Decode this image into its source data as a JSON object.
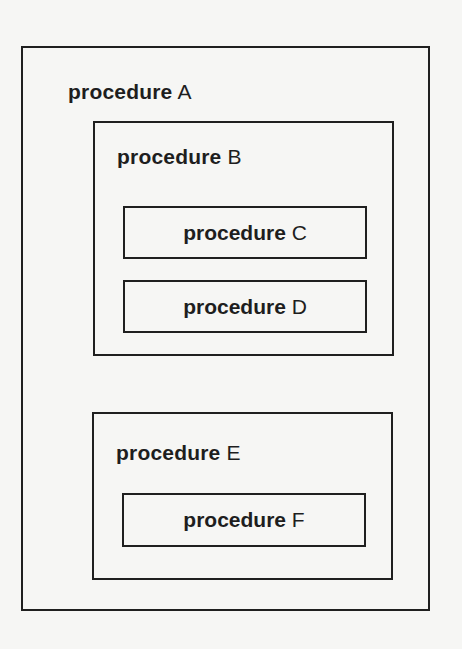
{
  "diagram": {
    "type": "nested-procedure-scopes",
    "keyword": "procedure",
    "procedures": {
      "A": {
        "keyword": "procedure",
        "name": "A",
        "contains": [
          "B",
          "E"
        ]
      },
      "B": {
        "keyword": "procedure",
        "name": "B",
        "contains": [
          "C",
          "D"
        ]
      },
      "C": {
        "keyword": "procedure",
        "name": "C",
        "contains": []
      },
      "D": {
        "keyword": "procedure",
        "name": "D",
        "contains": []
      },
      "E": {
        "keyword": "procedure",
        "name": "E",
        "contains": [
          "F"
        ]
      },
      "F": {
        "keyword": "procedure",
        "name": "F",
        "contains": []
      }
    }
  }
}
